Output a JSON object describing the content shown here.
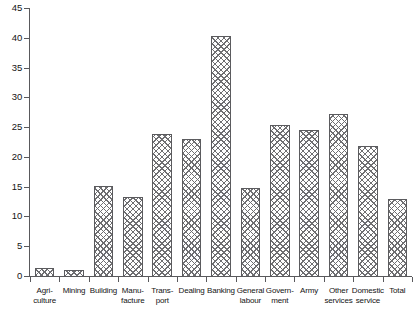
{
  "chart_data": {
    "type": "bar",
    "title": "",
    "subtitle": "",
    "xlabel": "",
    "ylabel": "",
    "ylim": [
      0,
      45
    ],
    "yticks": [
      0,
      5,
      10,
      15,
      20,
      25,
      30,
      35,
      40,
      45
    ],
    "grid": false,
    "legend": "none",
    "orientation": "vertical",
    "bar_fill": "cross-hatch",
    "categories": [
      "Agri-\nculture",
      "Mining",
      "Building",
      "Manu-\nfacture",
      "Trans-\nport",
      "Dealing",
      "Banking",
      "General\nlabour",
      "Govern-\nment",
      "Army",
      "Other\nservices",
      "Domestic\nservice",
      "Total"
    ],
    "values": [
      1.5,
      1.2,
      15.3,
      13.4,
      24.0,
      23.2,
      40.4,
      14.9,
      25.6,
      24.7,
      27.3,
      22.0,
      13.1
    ],
    "series": [
      {
        "name": "",
        "values": [
          1.5,
          1.2,
          15.3,
          13.4,
          24.0,
          23.2,
          40.4,
          14.9,
          25.6,
          24.7,
          27.3,
          22.0,
          13.1
        ]
      }
    ]
  },
  "colors": {
    "axis": "#59595c",
    "bar_outline": "#5b5b5e",
    "bar_hatch": "#6e6e71",
    "background": "#ffffff",
    "text": "#141414"
  }
}
